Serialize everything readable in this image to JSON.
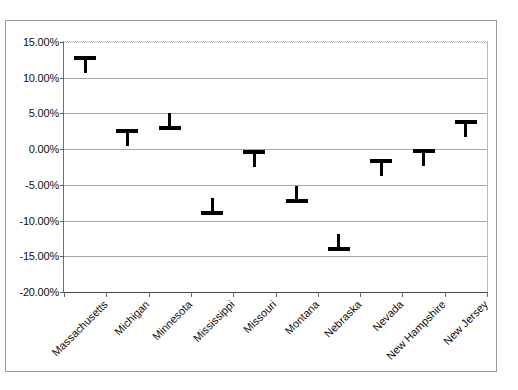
{
  "chart_data": {
    "type": "scatter",
    "title": "",
    "subtitle": "",
    "xlabel": "",
    "ylabel": "",
    "grid": true,
    "legend": false,
    "ylim": [
      -20,
      15
    ],
    "ytick_labels": [
      "15.00%",
      "10.00%",
      "5.00%",
      "0.00%",
      "-5.00%",
      "-10.00%",
      "-15.00%",
      "-20.00%"
    ],
    "ytick_values": [
      15,
      10,
      5,
      0,
      -5,
      -10,
      -15,
      -20
    ],
    "categories": [
      "Massachusetts",
      "Michigan",
      "Minnesota",
      "Mississippi",
      "Missouri",
      "Montana",
      "Nebraska",
      "Nevada",
      "New Hampshire",
      "New Jersey"
    ],
    "values": [
      12.7,
      2.5,
      3.0,
      -9.0,
      -0.4,
      -7.3,
      -14.0,
      -1.6,
      -0.2,
      3.8
    ],
    "marker_style": [
      "cap-top",
      "cap-top",
      "cap-bottom",
      "cap-bottom",
      "cap-top",
      "cap-bottom",
      "cap-bottom",
      "cap-top",
      "cap-top",
      "cap-top"
    ],
    "series": [
      {
        "name": "percent change",
        "values": [
          12.7,
          2.5,
          3.0,
          -9.0,
          -0.4,
          -7.3,
          -14.0,
          -1.6,
          -0.2,
          3.8
        ]
      }
    ]
  },
  "colors": {
    "marker": "#000000",
    "gridline": "#a8a8a8",
    "axis": "#4a4a4a",
    "frame": "#9a9a9a",
    "background": "#ffffff",
    "text": "#111111"
  }
}
